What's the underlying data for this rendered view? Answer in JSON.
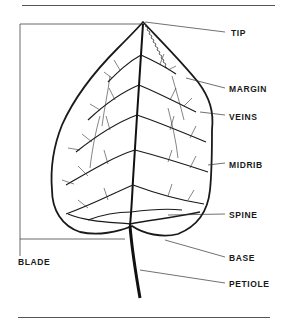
{
  "diagram": {
    "colors": {
      "ink": "#1a1a1a",
      "leader": "#333333",
      "rule": "#555555",
      "background": "#ffffff"
    },
    "labels": [
      {
        "id": "tip",
        "text": "TIP",
        "x": 231,
        "y": 28
      },
      {
        "id": "margin",
        "text": "MARGIN",
        "x": 229,
        "y": 84
      },
      {
        "id": "veins",
        "text": "VEINS",
        "x": 229,
        "y": 112
      },
      {
        "id": "midrib",
        "text": "MIDRIB",
        "x": 229,
        "y": 160
      },
      {
        "id": "spine",
        "text": "SPINE",
        "x": 229,
        "y": 210
      },
      {
        "id": "base",
        "text": "BASE",
        "x": 229,
        "y": 253
      },
      {
        "id": "petiole",
        "text": "PETIOLE",
        "x": 229,
        "y": 279
      },
      {
        "id": "blade",
        "text": "BLADE",
        "x": 18,
        "y": 257
      }
    ]
  }
}
